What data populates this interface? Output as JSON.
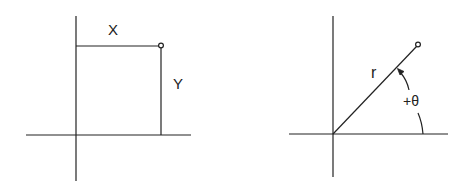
{
  "colors": {
    "background": "#ffffff",
    "line": "#222222"
  },
  "cartesian": {
    "x_label": "X",
    "y_label": "Y",
    "point_marker": "small-circle"
  },
  "polar": {
    "r_label": "r",
    "theta_label": "+θ",
    "point_marker": "small-circle",
    "angle_arrow": "arrowhead-at-ray"
  }
}
